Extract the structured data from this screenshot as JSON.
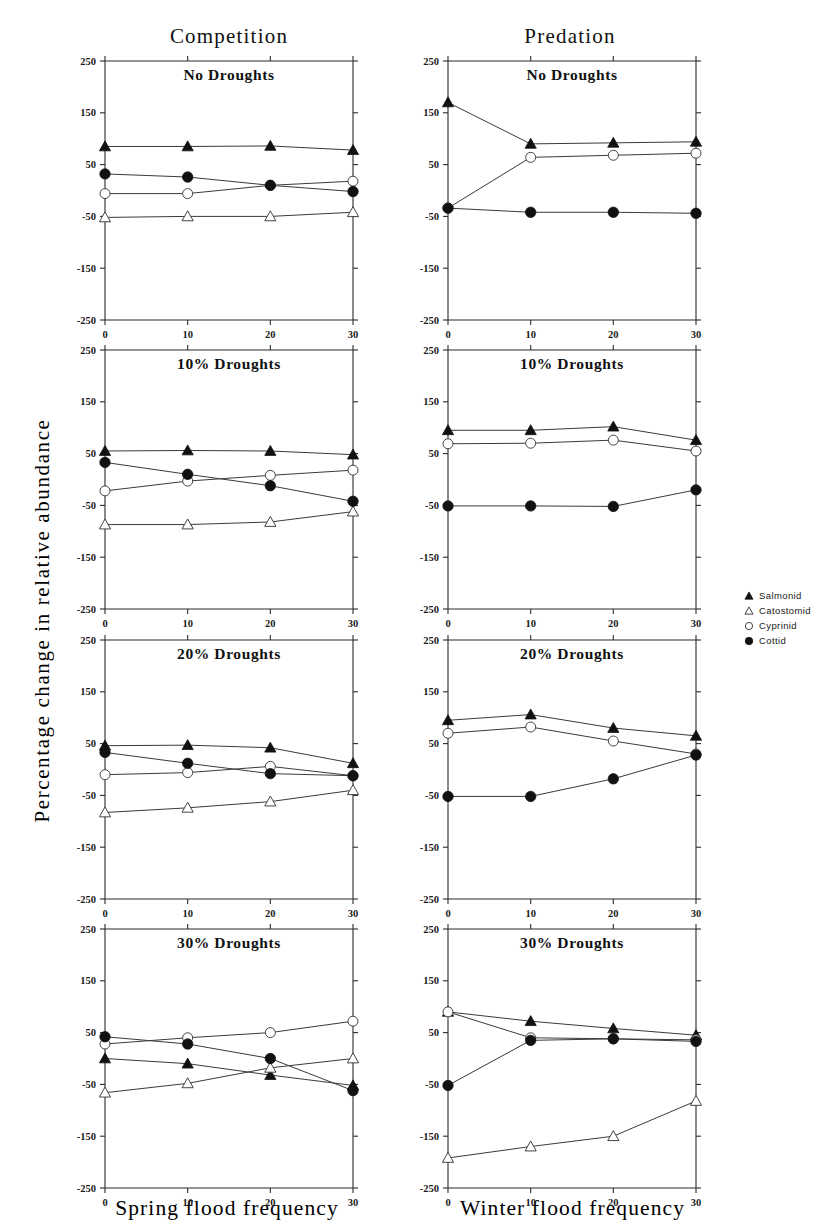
{
  "figure": {
    "ylabel": "Percentage change in relative abundance",
    "columns": [
      {
        "title": "Competition",
        "xlabel": "Spring flood frequency"
      },
      {
        "title": "Predation",
        "xlabel": "Winter flood frequency"
      }
    ]
  },
  "legend": {
    "position": "right",
    "entries": [
      {
        "label": "Salmonid",
        "marker": "filled-triangle-icon"
      },
      {
        "label": "Catostomid",
        "marker": "open-triangle-icon"
      },
      {
        "label": "Cyprinid",
        "marker": "open-circle-icon"
      },
      {
        "label": "Cottid",
        "marker": "filled-circle-icon"
      }
    ]
  },
  "axes": {
    "yticks": [
      250,
      150,
      50,
      -50,
      -150,
      -250
    ],
    "ytick_labels": [
      "250",
      "150",
      "50",
      "-50",
      "-150",
      "-250"
    ],
    "xticks": [
      0,
      10,
      20,
      30
    ],
    "xtick_labels": [
      "0",
      "10",
      "20",
      "30"
    ],
    "ylim": [
      -250,
      250
    ],
    "xlim": [
      0,
      30
    ],
    "grid": false
  },
  "chart_data": [
    {
      "type": "line",
      "title": "No Droughts",
      "column": "Competition",
      "xlabel": "Spring flood frequency",
      "ylabel": "Percentage change in relative abundance",
      "x": [
        0,
        10,
        20,
        30
      ],
      "xlim": [
        0,
        30
      ],
      "ylim": [
        -250,
        250
      ],
      "series": [
        {
          "name": "Salmonid",
          "marker": "filled-triangle",
          "values": [
            85,
            85,
            86,
            78
          ]
        },
        {
          "name": "Catostomid",
          "marker": "open-triangle",
          "values": [
            -52,
            -50,
            -50,
            -42
          ]
        },
        {
          "name": "Cyprinid",
          "marker": "open-circle",
          "values": [
            -6,
            -6,
            10,
            18
          ]
        },
        {
          "name": "Cottid",
          "marker": "filled-circle",
          "values": [
            32,
            26,
            10,
            -2
          ]
        }
      ]
    },
    {
      "type": "line",
      "title": "10% Droughts",
      "column": "Competition",
      "xlabel": "Spring flood frequency",
      "ylabel": "Percentage change in relative abundance",
      "x": [
        0,
        10,
        20,
        30
      ],
      "xlim": [
        0,
        30
      ],
      "ylim": [
        -250,
        250
      ],
      "series": [
        {
          "name": "Salmonid",
          "marker": "filled-triangle",
          "values": [
            55,
            56,
            55,
            48
          ]
        },
        {
          "name": "Catostomid",
          "marker": "open-triangle",
          "values": [
            -87,
            -87,
            -82,
            -62
          ]
        },
        {
          "name": "Cyprinid",
          "marker": "open-circle",
          "values": [
            -22,
            -3,
            8,
            18
          ]
        },
        {
          "name": "Cottid",
          "marker": "filled-circle",
          "values": [
            33,
            10,
            -12,
            -42
          ]
        }
      ]
    },
    {
      "type": "line",
      "title": "20% Droughts",
      "column": "Competition",
      "xlabel": "Spring flood frequency",
      "ylabel": "Percentage change in relative abundance",
      "x": [
        0,
        10,
        20,
        30
      ],
      "xlim": [
        0,
        30
      ],
      "ylim": [
        -250,
        250
      ],
      "series": [
        {
          "name": "Salmonid",
          "marker": "filled-triangle",
          "values": [
            46,
            47,
            42,
            12
          ]
        },
        {
          "name": "Catostomid",
          "marker": "open-triangle",
          "values": [
            -83,
            -74,
            -62,
            -40
          ]
        },
        {
          "name": "Cyprinid",
          "marker": "open-circle",
          "values": [
            -10,
            -6,
            6,
            -12
          ]
        },
        {
          "name": "Cottid",
          "marker": "filled-circle",
          "values": [
            33,
            12,
            -8,
            -12
          ]
        }
      ]
    },
    {
      "type": "line",
      "title": "30% Droughts",
      "column": "Competition",
      "xlabel": "Spring flood frequency",
      "ylabel": "Percentage change in relative abundance",
      "x": [
        0,
        10,
        20,
        30
      ],
      "xlim": [
        0,
        30
      ],
      "ylim": [
        -250,
        250
      ],
      "series": [
        {
          "name": "Salmonid",
          "marker": "filled-triangle",
          "values": [
            0,
            -10,
            -32,
            -52
          ]
        },
        {
          "name": "Catostomid",
          "marker": "open-triangle",
          "values": [
            -66,
            -48,
            -18,
            0
          ]
        },
        {
          "name": "Cyprinid",
          "marker": "open-circle",
          "values": [
            28,
            40,
            50,
            72
          ]
        },
        {
          "name": "Cottid",
          "marker": "filled-circle",
          "values": [
            42,
            28,
            0,
            -62
          ]
        }
      ]
    },
    {
      "type": "line",
      "title": "No Droughts",
      "column": "Predation",
      "xlabel": "Winter flood frequency",
      "ylabel": "Percentage change in relative abundance",
      "x": [
        0,
        10,
        20,
        30
      ],
      "xlim": [
        0,
        30
      ],
      "ylim": [
        -250,
        250
      ],
      "series": [
        {
          "name": "Salmonid",
          "marker": "filled-triangle",
          "values": [
            170,
            90,
            92,
            94
          ]
        },
        {
          "name": "Cyprinid",
          "marker": "open-circle",
          "values": [
            -34,
            64,
            68,
            72
          ]
        },
        {
          "name": "Cottid",
          "marker": "filled-circle",
          "values": [
            -34,
            -42,
            -42,
            -44
          ]
        }
      ]
    },
    {
      "type": "line",
      "title": "10% Droughts",
      "column": "Predation",
      "xlabel": "Winter flood frequency",
      "ylabel": "Percentage change in relative abundance",
      "x": [
        0,
        10,
        20,
        30
      ],
      "xlim": [
        0,
        30
      ],
      "ylim": [
        -250,
        250
      ],
      "series": [
        {
          "name": "Salmonid",
          "marker": "filled-triangle",
          "values": [
            95,
            95,
            102,
            76
          ]
        },
        {
          "name": "Cyprinid",
          "marker": "open-circle",
          "values": [
            69,
            70,
            76,
            55
          ]
        },
        {
          "name": "Cottid",
          "marker": "filled-circle",
          "values": [
            -51,
            -51,
            -52,
            -20
          ]
        }
      ]
    },
    {
      "type": "line",
      "title": "20% Droughts",
      "column": "Predation",
      "xlabel": "Winter flood frequency",
      "ylabel": "Percentage change in relative abundance",
      "x": [
        0,
        10,
        20,
        30
      ],
      "xlim": [
        0,
        30
      ],
      "ylim": [
        -250,
        250
      ],
      "series": [
        {
          "name": "Salmonid",
          "marker": "filled-triangle",
          "values": [
            95,
            106,
            80,
            65
          ]
        },
        {
          "name": "Cyprinid",
          "marker": "open-circle",
          "values": [
            70,
            82,
            55,
            30
          ]
        },
        {
          "name": "Cottid",
          "marker": "filled-circle",
          "values": [
            -52,
            -52,
            -18,
            28
          ]
        }
      ]
    },
    {
      "type": "line",
      "title": "30% Droughts",
      "column": "Predation",
      "xlabel": "Winter flood frequency",
      "ylabel": "Percentage change in relative abundance",
      "x": [
        0,
        10,
        20,
        30
      ],
      "xlim": [
        0,
        30
      ],
      "ylim": [
        -250,
        250
      ],
      "series": [
        {
          "name": "Salmonid",
          "marker": "filled-triangle",
          "values": [
            90,
            72,
            58,
            45
          ]
        },
        {
          "name": "Catostomid",
          "marker": "open-triangle",
          "values": [
            -192,
            -170,
            -150,
            -82
          ]
        },
        {
          "name": "Cyprinid",
          "marker": "open-circle",
          "values": [
            90,
            40,
            38,
            36
          ]
        },
        {
          "name": "Cottid",
          "marker": "filled-circle",
          "values": [
            -52,
            35,
            38,
            33
          ]
        }
      ]
    }
  ]
}
